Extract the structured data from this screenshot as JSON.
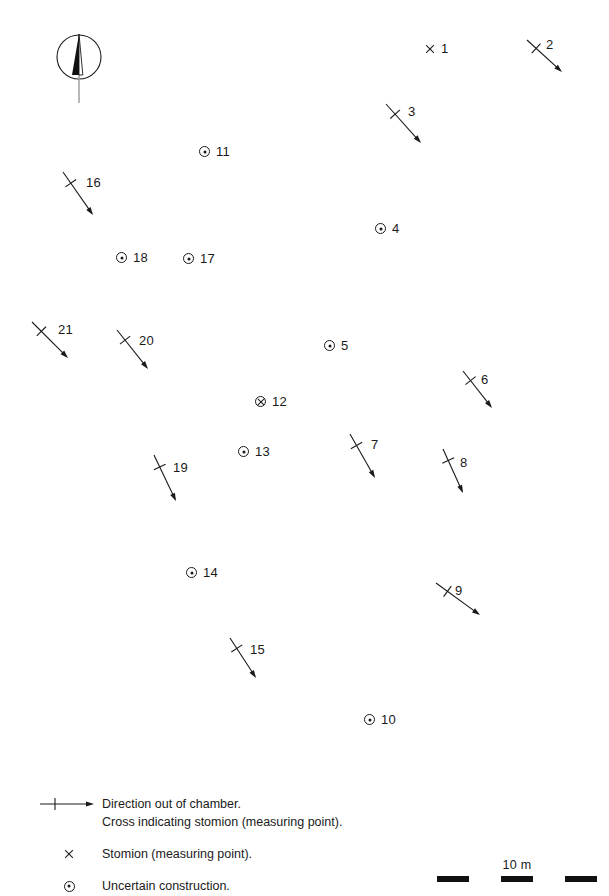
{
  "map": {
    "title": "Chamber tomb orientation plan",
    "background": "#ffffff",
    "ink": "#1a1a1a",
    "compass": {
      "name": "north-arrow",
      "cx": 79,
      "cy": 57,
      "radius": 22
    },
    "markers": [
      {
        "id": "1",
        "type": "cross",
        "x": 424,
        "y": 48,
        "label": "1"
      },
      {
        "id": "11",
        "type": "circle-dot",
        "x": 199,
        "y": 151,
        "label": "11"
      },
      {
        "id": "4",
        "type": "circle-dot",
        "x": 375,
        "y": 228,
        "label": "4"
      },
      {
        "id": "18",
        "type": "circle-dot",
        "x": 116,
        "y": 257,
        "label": "18"
      },
      {
        "id": "17",
        "type": "circle-dot",
        "x": 183,
        "y": 258,
        "label": "17"
      },
      {
        "id": "5",
        "type": "circle-dot",
        "x": 324,
        "y": 345,
        "label": "5"
      },
      {
        "id": "12",
        "type": "circle-x",
        "x": 255,
        "y": 401,
        "label": "12"
      },
      {
        "id": "13",
        "type": "circle-dot",
        "x": 238,
        "y": 451,
        "label": "13"
      },
      {
        "id": "14",
        "type": "circle-dot",
        "x": 186,
        "y": 572,
        "label": "14"
      },
      {
        "id": "10",
        "type": "circle-dot",
        "x": 364,
        "y": 719,
        "label": "10"
      }
    ],
    "arrows": [
      {
        "id": "2",
        "label": "2",
        "x1": 527,
        "y1": 40,
        "x2": 562,
        "y2": 72,
        "lx": 546,
        "ly": 38
      },
      {
        "id": "3",
        "label": "3",
        "x1": 386,
        "y1": 104,
        "x2": 421,
        "y2": 143,
        "lx": 408,
        "ly": 105
      },
      {
        "id": "16",
        "label": "16",
        "x1": 63,
        "y1": 172,
        "x2": 93,
        "y2": 215,
        "lx": 86,
        "ly": 176
      },
      {
        "id": "21",
        "label": "21",
        "x1": 32,
        "y1": 322,
        "x2": 68,
        "y2": 358,
        "lx": 58,
        "ly": 323
      },
      {
        "id": "20",
        "label": "20",
        "x1": 117,
        "y1": 330,
        "x2": 148,
        "y2": 369,
        "lx": 139,
        "ly": 334
      },
      {
        "id": "6",
        "label": "6",
        "x1": 463,
        "y1": 371,
        "x2": 492,
        "y2": 408,
        "lx": 481,
        "ly": 373
      },
      {
        "id": "7",
        "label": "7",
        "x1": 350,
        "y1": 434,
        "x2": 375,
        "y2": 478,
        "lx": 371,
        "ly": 438
      },
      {
        "id": "8",
        "label": "8",
        "x1": 443,
        "y1": 449,
        "x2": 463,
        "y2": 493,
        "lx": 460,
        "ly": 456
      },
      {
        "id": "19",
        "label": "19",
        "x1": 154,
        "y1": 455,
        "x2": 176,
        "y2": 501,
        "lx": 173,
        "ly": 461
      },
      {
        "id": "9",
        "label": "9",
        "x1": 436,
        "y1": 583,
        "x2": 480,
        "y2": 615,
        "lx": 455,
        "ly": 584
      },
      {
        "id": "15",
        "label": "15",
        "x1": 230,
        "y1": 638,
        "x2": 256,
        "y2": 678,
        "lx": 250,
        "ly": 643
      }
    ]
  },
  "legend": {
    "rows": [
      {
        "symbol": "arrow-with-cross",
        "lines": [
          "Direction out of chamber.",
          "Cross indicating stomion (measuring point)."
        ]
      },
      {
        "symbol": "cross",
        "lines": [
          "Stomion (measuring point)."
        ]
      },
      {
        "symbol": "circle-dot",
        "lines": [
          "Uncertain construction."
        ]
      }
    ]
  },
  "scale": {
    "label": "10 m",
    "segments": [
      "on",
      "off",
      "on",
      "off",
      "on"
    ]
  }
}
